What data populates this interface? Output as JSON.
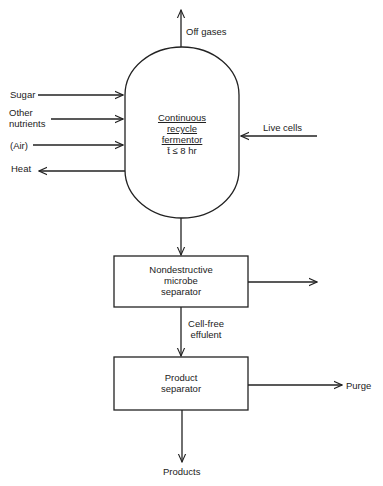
{
  "diagram": {
    "fermentor": {
      "line1": "Continuous",
      "line2": "recycle",
      "line3": "fermentor",
      "residence_time": "t̄  ≤  8 hr"
    },
    "inputs": {
      "sugar": "Sugar",
      "other_nutrients_1": "Other",
      "other_nutrients_2": "nutrients",
      "air": "(Air)",
      "live_cells": "Live cells"
    },
    "outputs": {
      "off_gases": "Off gases",
      "heat": "Heat",
      "purge": "Purge",
      "products": "Products"
    },
    "microbe_separator": {
      "line1": "Nondestructive",
      "line2": "microbe",
      "line3": "separator"
    },
    "effluent": {
      "line1": "Cell-free",
      "line2": "effulent"
    },
    "product_separator": {
      "line1": "Product",
      "line2": "separator"
    },
    "colors": {
      "stroke": "#222222",
      "background": "#ffffff"
    }
  }
}
